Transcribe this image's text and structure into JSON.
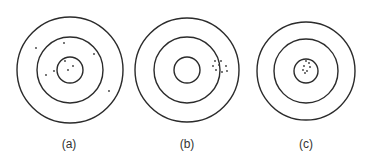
{
  "figure": {
    "stroke_color": "#2b2b2b",
    "dot_color": "#3a3a3a",
    "targets": [
      {
        "label": "(a)",
        "center": [
          70,
          70
        ],
        "radii": [
          53,
          33,
          13
        ],
        "shots": [
          [
            36,
            48
          ],
          [
            64,
            43
          ],
          [
            94,
            54
          ],
          [
            65,
            61
          ],
          [
            73,
            66
          ],
          [
            68,
            70
          ],
          [
            54,
            71
          ],
          [
            46,
            75
          ],
          [
            109,
            91
          ]
        ]
      },
      {
        "label": "(b)",
        "center": [
          187,
          70
        ],
        "radii": [
          52,
          33,
          13
        ],
        "shots": [
          [
            215,
            61
          ],
          [
            221,
            61
          ],
          [
            213,
            66
          ],
          [
            219,
            65
          ],
          [
            226,
            66
          ],
          [
            216,
            70
          ],
          [
            222,
            72
          ],
          [
            227,
            71
          ]
        ]
      },
      {
        "label": "(c)",
        "center": [
          306,
          71
        ],
        "radii": [
          49,
          32,
          12
        ],
        "shots": [
          [
            306,
            61
          ],
          [
            309,
            63
          ],
          [
            304,
            66
          ],
          [
            310,
            67
          ],
          [
            303,
            70
          ],
          [
            307,
            71
          ],
          [
            305,
            73
          ]
        ]
      }
    ]
  }
}
